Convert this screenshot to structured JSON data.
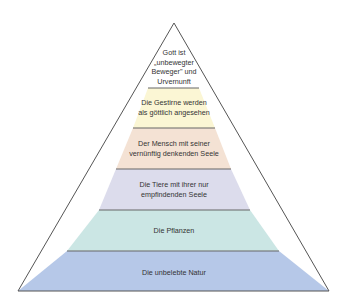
{
  "diagram": {
    "type": "pyramid",
    "layers": [
      {
        "label": "Gott ist „unbewegter Beweger\" und Urvernunft",
        "lines": [
          "Gott ist",
          "„unbewegter",
          "Beweger\" und",
          "Urvernunft"
        ],
        "color": "#ffffff"
      },
      {
        "label": "Die Gestirne werden als göttlich angesehen",
        "lines": [
          "Die Gestirne werden",
          "als göttlich angesehen"
        ],
        "color": "#fbf6d4"
      },
      {
        "label": "Der Mensch mit seiner vernünftig denkenden Seele",
        "lines": [
          "Der Mensch mit seiner",
          "vernünftig denkenden Seele"
        ],
        "color": "#f4e2d4"
      },
      {
        "label": "Die Tiere mit ihrer nur empfindenden Seele",
        "lines": [
          "Die Tiere mit ihrer nur",
          "empfindenden Seele"
        ],
        "color": "#dcdcec"
      },
      {
        "label": "Die Pflanzen",
        "lines": [
          "Die Pflanzen"
        ],
        "color": "#cbe6e4"
      },
      {
        "label": "Die unbelebte Natur",
        "lines": [
          "Die unbelebte Natur"
        ],
        "color": "#b6c8e8"
      }
    ],
    "outline_color": "#555555"
  }
}
